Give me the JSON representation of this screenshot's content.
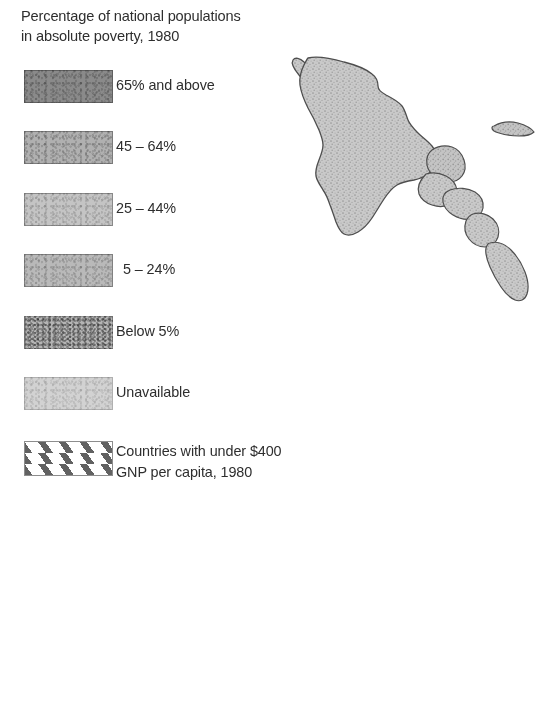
{
  "legend": {
    "title": "Percentage of national populations\nin absolute poverty, 1980",
    "items": [
      {
        "label": "65% and above",
        "swatch": "solid-dark-gray",
        "color": "#8a8a8a",
        "indent": false
      },
      {
        "label": "45 – 64%",
        "swatch": "solid-mid-gray",
        "color": "#b0b0b0",
        "indent": false
      },
      {
        "label": "25 – 44%",
        "swatch": "solid-light-gray",
        "color": "#c2c2c2",
        "indent": false
      },
      {
        "label": "5 – 24%",
        "swatch": "solid-pale-gray",
        "color": "#b8b8b8",
        "indent": true
      },
      {
        "label": "Below 5%",
        "swatch": "mottled-gray",
        "color": "#a6a6a6",
        "indent": false
      },
      {
        "label": "Unavailable",
        "swatch": "solid-very-light",
        "color": "#cfcfcf",
        "indent": false
      },
      {
        "label": "Countries with under $400\nGNP per capita, 1980",
        "swatch": "diagonal-hatch",
        "color": "#ffffff",
        "indent": false
      }
    ]
  },
  "map": {
    "name": "mexico-central-america-map",
    "region": "Mexico and Central America",
    "fill": "#c6c6c6",
    "stroke": "#4a4a4a"
  }
}
